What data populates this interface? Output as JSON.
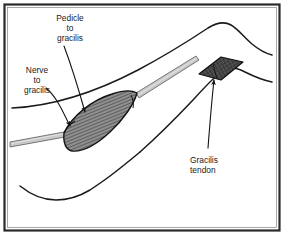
{
  "figure": {
    "background_color": "#ffffff",
    "border_color": "#2b2b2b",
    "outline_color": "#1a1a1a",
    "muscle_fill": "#8c8c8c",
    "muscle_hatch_color": "#2e2e2e",
    "tendon_band_color": "#c9c9c9",
    "tendon_patch_fill": "#4a4a4a",
    "label_color": "#1a1a1a"
  },
  "labels": {
    "pedicle": {
      "line1": "Pedicle",
      "line2": "to",
      "line3": "gracilis",
      "align": "center"
    },
    "nerve": {
      "line1": "Nerve",
      "line2": "to",
      "line3": "gracilis",
      "align": "center"
    },
    "tendon": {
      "line1": "Gracilis",
      "line2": "tendon",
      "align": "start"
    }
  },
  "parts": {
    "muscle_belly": "gracilis-muscle-belly",
    "tendon_band": "gracilis-tendon-band",
    "tendon_patch": "gracilis-tendon-patch",
    "leg_outline": "leg-contour",
    "knee_outline": "knee-contour"
  }
}
